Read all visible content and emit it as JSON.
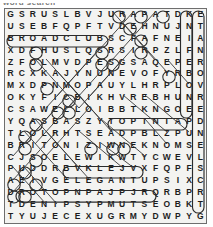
{
  "caption": "word search",
  "puzzle": {
    "title": "Word Search Grid",
    "columns": 18,
    "rows": 18,
    "grid": [
      [
        "G",
        "S",
        "R",
        "U",
        "S",
        "L",
        "B",
        "V",
        "J",
        "U",
        "R",
        "A",
        "P",
        "A",
        "T",
        "D",
        "K",
        "E"
      ],
      [
        "U",
        "S",
        "E",
        "B",
        "F",
        "Q",
        "P",
        "F",
        "T",
        "V",
        "D",
        "E",
        "H",
        "N",
        "U",
        "J",
        "N",
        "T"
      ],
      [
        "B",
        "R",
        "O",
        "A",
        "D",
        "C",
        "L",
        "U",
        "B",
        "S",
        "C",
        "F",
        "A",
        "F",
        "N",
        "E",
        "I",
        "A"
      ],
      [
        "X",
        "D",
        "F",
        "H",
        "U",
        "S",
        "L",
        "Q",
        "S",
        "R",
        "S",
        "I",
        "R",
        "P",
        "Z",
        "L",
        "F",
        "N"
      ],
      [
        "Z",
        "F",
        "O",
        "L",
        "M",
        "V",
        "D",
        "P",
        "E",
        "S",
        "G",
        "S",
        "A",
        "Q",
        "E",
        "P",
        "E",
        "R"
      ],
      [
        "R",
        "C",
        "X",
        "K",
        "A",
        "J",
        "Y",
        "N",
        "U",
        "N",
        "E",
        "V",
        "O",
        "F",
        "Y",
        "R",
        "B",
        "O"
      ],
      [
        "M",
        "X",
        "D",
        "P",
        "N",
        "M",
        "O",
        "P",
        "A",
        "U",
        "Y",
        "L",
        "H",
        "R",
        "P",
        "L",
        "O",
        "V"
      ],
      [
        "O",
        "K",
        "Y",
        "F",
        "I",
        "C",
        "B",
        "I",
        "K",
        "H",
        "V",
        "R",
        "E",
        "B",
        "H",
        "U",
        "N",
        "R"
      ],
      [
        "C",
        "S",
        "A",
        "W",
        "E",
        "L",
        "L",
        "O",
        "I",
        "B",
        "B",
        "T",
        "K",
        "N",
        "G",
        "O",
        "E",
        "E"
      ],
      [
        "Y",
        "Q",
        "A",
        "S",
        "B",
        "A",
        "S",
        "Z",
        "Y",
        "T",
        "O",
        "P",
        "T",
        "N",
        "I",
        "A",
        "P",
        "D"
      ],
      [
        "T",
        "L",
        "O",
        "L",
        "R",
        "H",
        "T",
        "S",
        "E",
        "A",
        "D",
        "P",
        "B",
        "L",
        "Z",
        "P",
        "U",
        "N"
      ],
      [
        "B",
        "R",
        "I",
        "T",
        "O",
        "N",
        "I",
        "Z",
        "I",
        "W",
        "N",
        "E",
        "K",
        "N",
        "O",
        "M",
        "S",
        "E"
      ],
      [
        "C",
        "J",
        "S",
        "O",
        "E",
        "L",
        "E",
        "W",
        "I",
        "K",
        "W",
        "T",
        "Y",
        "C",
        "W",
        "E",
        "V",
        "L"
      ],
      [
        "P",
        "U",
        "D",
        "D",
        "R",
        "B",
        "V",
        "K",
        "L",
        "E",
        "J",
        "V",
        "X",
        "F",
        "Q",
        "P",
        "F",
        "S"
      ],
      [
        "A",
        "E",
        "I",
        "V",
        "G",
        "E",
        "L",
        "E",
        "G",
        "A",
        "N",
        "T",
        "U",
        "P",
        "S",
        "I",
        "X",
        "C"
      ],
      [
        "D",
        "R",
        "O",
        "T",
        "O",
        "P",
        "N",
        "P",
        "A",
        "J",
        "P",
        "J",
        "R",
        "Q",
        "R",
        "B",
        "P",
        "R"
      ],
      [
        "T",
        "D",
        "E",
        "N",
        "I",
        "P",
        "S",
        "Y",
        "P",
        "M",
        "U",
        "T",
        "S",
        "E",
        "O",
        "B",
        "K",
        "T"
      ],
      [
        "T",
        "Y",
        "U",
        "J",
        "E",
        "C",
        "E",
        "X",
        "U",
        "G",
        "R",
        "M",
        "Y",
        "D",
        "W",
        "P",
        "Y",
        "G"
      ]
    ],
    "found_words": [
      {
        "text": "BROADCLUB",
        "row": 3,
        "start_col": 1,
        "end_col": 9,
        "direction": "horizontal"
      },
      {
        "text": "ELEGANT",
        "row": 15,
        "start_col": 6,
        "end_col": 12,
        "direction": "horizontal"
      },
      {
        "text": "TOPTNIA",
        "row": 10,
        "start_col": 10,
        "end_col": 16,
        "direction": "horizontal"
      },
      {
        "text": "DENIPSYPMUTS",
        "row": 17,
        "start_col": 2,
        "end_col": 13,
        "direction": "horizontal"
      },
      {
        "text": "KNIFEBONE",
        "col": 17,
        "start_row": 1,
        "end_row": 9,
        "direction": "vertical"
      },
      {
        "text": "ETANROVREDNELS",
        "col": 18,
        "start_row": 1,
        "end_row": 18,
        "direction": "vertical"
      }
    ],
    "colors": {
      "grid_background": "#f3f3f1",
      "border": "#6e6e6e",
      "letter": "#1d1d1d",
      "mark": "#2b2b2b",
      "page_background": "#ffffff"
    }
  }
}
